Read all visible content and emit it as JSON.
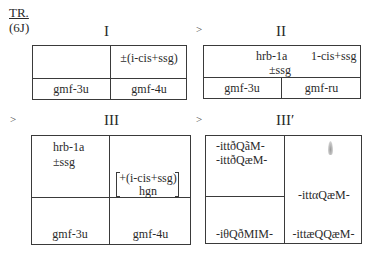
{
  "header": {
    "label": "TR.",
    "code": "(6J)"
  },
  "panels": [
    {
      "id": "I",
      "title": "I",
      "arrow": "",
      "top_cells": [
        "",
        "±(i-cis+ssg)"
      ],
      "bottom_cells": [
        "gmf-3u",
        "gmf-4u"
      ]
    },
    {
      "id": "II",
      "title": "II",
      "arrow": ">",
      "top_text": [
        "hrb-1a",
        "1-cis+ssg",
        "±ssg"
      ],
      "bottom_cells": [
        "gmf-3u",
        "gmf-ru"
      ]
    },
    {
      "id": "III",
      "title": "III",
      "arrow": ">",
      "top_left": [
        "hrb-1a",
        "±ssg"
      ],
      "bracket_text": [
        "+(i-cis+ssg)",
        "hgn"
      ],
      "bottom_cells": [
        "gmf-3u",
        "gmf-4u"
      ]
    },
    {
      "id": "III-prime",
      "title": "III′",
      "arrow": ">",
      "top_left": [
        "-ittðQãM-",
        "-ittðQæM-"
      ],
      "bottom_left": "-iθQðMIM-",
      "right_mid": "-ittαQæM-",
      "right_bottom": "-ittæQQæM-",
      "right_icon": "flame-icon"
    }
  ]
}
